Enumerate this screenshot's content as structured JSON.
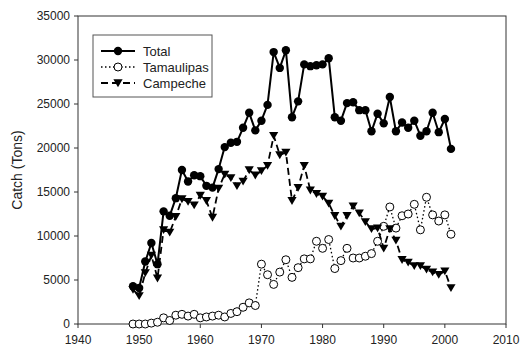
{
  "chart_data": {
    "type": "line",
    "title": "",
    "xlabel": "",
    "ylabel": "Catch (Tons)",
    "xlim": [
      1940,
      2010
    ],
    "ylim": [
      0,
      35000
    ],
    "xticks": [
      1940,
      1950,
      1960,
      1970,
      1980,
      1990,
      2000,
      2010
    ],
    "yticks": [
      0,
      5000,
      10000,
      15000,
      20000,
      25000,
      30000,
      35000
    ],
    "grid": false,
    "legend_position": "upper-left",
    "x": [
      1949,
      1950,
      1951,
      1952,
      1953,
      1954,
      1955,
      1956,
      1957,
      1958,
      1959,
      1960,
      1961,
      1962,
      1963,
      1964,
      1965,
      1966,
      1967,
      1968,
      1969,
      1970,
      1971,
      1972,
      1973,
      1974,
      1975,
      1976,
      1977,
      1978,
      1979,
      1980,
      1981,
      1982,
      1983,
      1984,
      1985,
      1986,
      1987,
      1988,
      1989,
      1990,
      1991,
      1992,
      1993,
      1994,
      1995,
      1996,
      1997,
      1998,
      1999,
      2000,
      2001
    ],
    "series": [
      {
        "name": "Total",
        "marker": "filled-circle",
        "line": "solid",
        "values": [
          4300,
          4100,
          7100,
          9200,
          6800,
          12800,
          12300,
          14300,
          17500,
          16200,
          16900,
          16800,
          15700,
          15500,
          17600,
          20100,
          20600,
          20700,
          22300,
          24000,
          22000,
          23100,
          24900,
          30900,
          29100,
          31100,
          23500,
          25300,
          29500,
          29300,
          29400,
          29500,
          30200,
          23500,
          23100,
          25100,
          25200,
          24300,
          24300,
          21900,
          23900,
          22800,
          25800,
          21900,
          22900,
          22300,
          23100,
          21400,
          21900,
          24000,
          21800,
          23300,
          19900
        ]
      },
      {
        "name": "Tamaulipas",
        "marker": "open-circle",
        "line": "dotted",
        "values": [
          0,
          0,
          0,
          100,
          200,
          700,
          400,
          1000,
          1100,
          900,
          1100,
          700,
          800,
          900,
          1000,
          800,
          1200,
          1400,
          1900,
          2400,
          2100,
          6800,
          5600,
          4500,
          5900,
          7300,
          5300,
          6400,
          7400,
          7400,
          9400,
          8600,
          9600,
          6300,
          7200,
          8600,
          7500,
          7500,
          7700,
          8000,
          9400,
          11100,
          13300,
          10900,
          12300,
          12500,
          13600,
          10700,
          14400,
          12400,
          11700,
          12400,
          10200
        ]
      },
      {
        "name": "Campeche",
        "marker": "filled-triangle-down",
        "line": "dashed",
        "values": [
          3900,
          3200,
          5800,
          7800,
          5200,
          10700,
          10400,
          12200,
          14200,
          13900,
          13500,
          14600,
          14000,
          12100,
          15400,
          17000,
          16600,
          15700,
          16200,
          17500,
          16900,
          17400,
          18000,
          21400,
          19200,
          19500,
          14000,
          15500,
          18000,
          15200,
          14800,
          14500,
          13700,
          12300,
          11100,
          12300,
          13400,
          12600,
          11600,
          10800,
          10900,
          8600,
          10800,
          9500,
          7300,
          7000,
          6600,
          6600,
          6200,
          5900,
          5600,
          6000,
          4100
        ]
      }
    ]
  },
  "legend": {
    "items": [
      "Total",
      "Tamaulipas",
      "Campeche"
    ]
  }
}
